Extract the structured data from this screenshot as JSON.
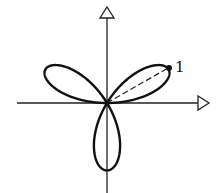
{
  "diagram": {
    "type": "polar-rose",
    "equation": "r = sin 3θ",
    "petals": 3,
    "petal_length": 1,
    "annotations": {
      "tip_label": "1"
    },
    "axes": {
      "x_arrow": true,
      "y_arrow": true
    },
    "colors": {
      "stroke": "#111111",
      "background": "#ffffff"
    }
  }
}
